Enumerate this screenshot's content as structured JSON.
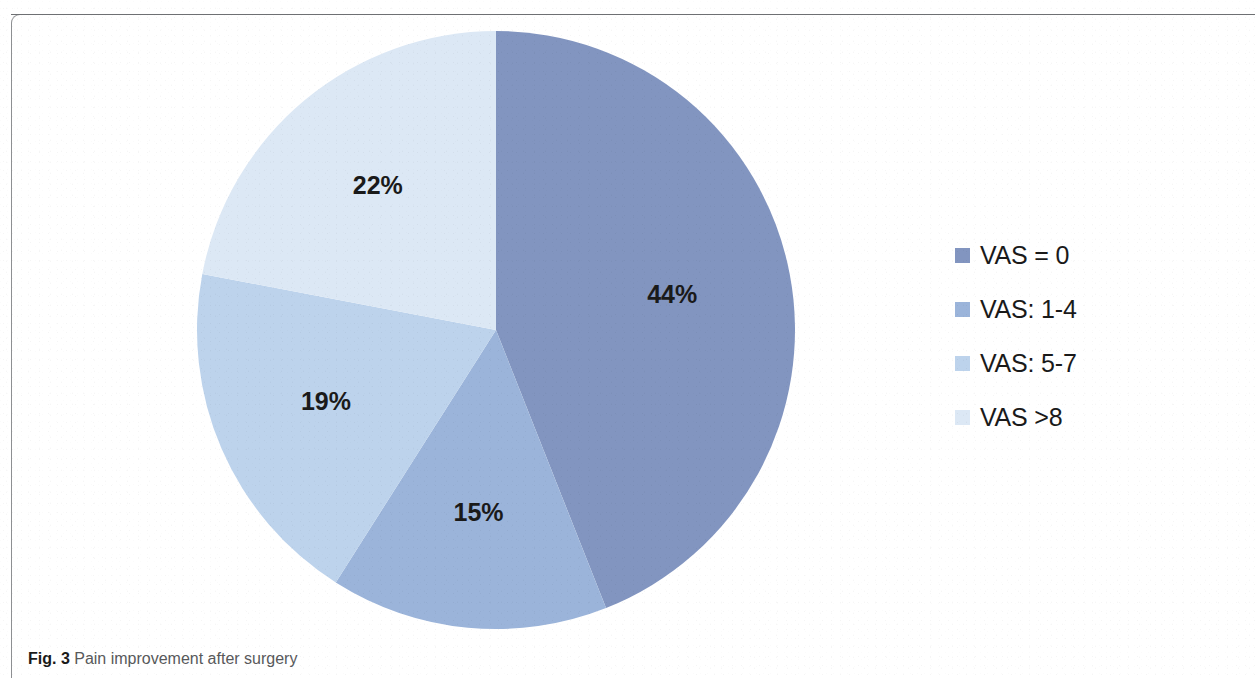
{
  "figure": {
    "caption_figno": "Fig. 3",
    "caption_text": " Pain improvement after surgery"
  },
  "legend": {
    "items": [
      {
        "label": "VAS = 0",
        "color": "#8295c0"
      },
      {
        "label": "VAS: 1-4",
        "color": "#9bb4da"
      },
      {
        "label": "VAS: 5-7",
        "color": "#bdd3ec"
      },
      {
        "label": "VAS >8",
        "color": "#dce8f5"
      }
    ]
  },
  "chart_data": {
    "type": "pie",
    "title": "Pain improvement after surgery",
    "categories": [
      "VAS = 0",
      "VAS: 1-4",
      "VAS: 5-7",
      "VAS >8"
    ],
    "values": [
      44,
      15,
      19,
      22
    ],
    "value_labels": [
      "44%",
      "15%",
      "19%",
      "22%"
    ],
    "unit": "%",
    "colors": [
      "#8295c0",
      "#9bb4da",
      "#bdd3ec",
      "#dce8f5"
    ],
    "start_angle_deg": 0,
    "direction": "clockwise",
    "legend_position": "right",
    "grid": false,
    "xlabel": "",
    "ylabel": ""
  }
}
